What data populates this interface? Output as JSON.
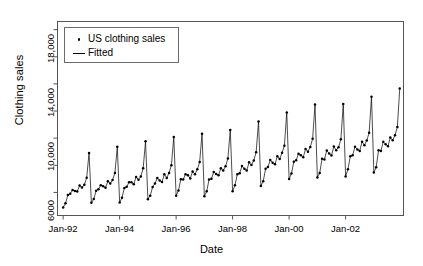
{
  "chart_data": {
    "type": "line",
    "title": "",
    "xlabel": "Date",
    "ylabel": "Clothing sales",
    "grid": false,
    "legend_position": "top-left",
    "xlim": [
      1991.8,
      2004.05
    ],
    "ylim": [
      4300,
      18600
    ],
    "y_ticks_major": [
      6000,
      10000,
      14000,
      18000
    ],
    "y_tick_labels": [
      "6000",
      "10,000",
      "14,000",
      "18,000"
    ],
    "y_ticks_minor": [
      8000,
      12000,
      16000
    ],
    "x_ticks": [
      1992,
      1994,
      1996,
      1998,
      2000,
      2002
    ],
    "x_tick_labels": [
      "Jan-92",
      "Jan-94",
      "Jan-96",
      "Jan-98",
      "Jan-00",
      "Jan-02"
    ],
    "series": [
      {
        "name": "US clothing sales",
        "kind": "points",
        "marker": "dot",
        "color": "#000000",
        "x": [
          1992.0,
          1992.083,
          1992.167,
          1992.25,
          1992.333,
          1992.417,
          1992.5,
          1992.583,
          1992.667,
          1992.75,
          1992.833,
          1992.917,
          1993.0,
          1993.083,
          1993.167,
          1993.25,
          1993.333,
          1993.417,
          1993.5,
          1993.583,
          1993.667,
          1993.75,
          1993.833,
          1993.917,
          1994.0,
          1994.083,
          1994.167,
          1994.25,
          1994.333,
          1994.417,
          1994.5,
          1994.583,
          1994.667,
          1994.75,
          1994.833,
          1994.917,
          1995.0,
          1995.083,
          1995.167,
          1995.25,
          1995.333,
          1995.417,
          1995.5,
          1995.583,
          1995.667,
          1995.75,
          1995.833,
          1995.917,
          1996.0,
          1996.083,
          1996.167,
          1996.25,
          1996.333,
          1996.417,
          1996.5,
          1996.583,
          1996.667,
          1996.75,
          1996.833,
          1996.917,
          1997.0,
          1997.083,
          1997.167,
          1997.25,
          1997.333,
          1997.417,
          1997.5,
          1997.583,
          1997.667,
          1997.75,
          1997.833,
          1997.917,
          1998.0,
          1998.083,
          1998.167,
          1998.25,
          1998.333,
          1998.417,
          1998.5,
          1998.583,
          1998.667,
          1998.75,
          1998.833,
          1998.917,
          1999.0,
          1999.083,
          1999.167,
          1999.25,
          1999.333,
          1999.417,
          1999.5,
          1999.583,
          1999.667,
          1999.75,
          1999.833,
          1999.917,
          2000.0,
          2000.083,
          2000.167,
          2000.25,
          2000.333,
          2000.417,
          2000.5,
          2000.583,
          2000.667,
          2000.75,
          2000.833,
          2000.917,
          2001.0,
          2001.083,
          2001.167,
          2001.25,
          2001.333,
          2001.417,
          2001.5,
          2001.583,
          2001.667,
          2001.75,
          2001.833,
          2001.917,
          2002.0,
          2002.083,
          2002.167,
          2002.25,
          2002.333,
          2002.417,
          2002.5,
          2002.583,
          2002.667,
          2002.75,
          2002.833,
          2002.917,
          2003.0,
          2003.083,
          2003.167,
          2003.25,
          2003.333,
          2003.417,
          2003.5,
          2003.583,
          2003.667,
          2003.75,
          2003.833,
          2003.917
        ],
        "y": [
          4889,
          5197,
          5805,
          5912,
          6171,
          6100,
          6077,
          6513,
          6357,
          6562,
          7078,
          8910,
          5246,
          5510,
          6127,
          6244,
          6534,
          6451,
          6354,
          6831,
          6655,
          6918,
          7432,
          9375,
          5261,
          5611,
          6334,
          6419,
          6757,
          6743,
          6601,
          7139,
          6944,
          7182,
          7780,
          9770,
          5507,
          5763,
          6396,
          6653,
          7056,
          6887,
          6762,
          7338,
          7073,
          7441,
          8006,
          10091,
          5754,
          6138,
          6977,
          6949,
          7348,
          7275,
          7022,
          7540,
          7338,
          7708,
          8235,
          10330,
          5722,
          6085,
          6962,
          7003,
          7512,
          7365,
          7258,
          7783,
          7613,
          7930,
          8496,
          10605,
          6088,
          6534,
          7336,
          7417,
          7955,
          7742,
          7617,
          8222,
          8020,
          8355,
          8968,
          11226,
          6469,
          6819,
          7739,
          7872,
          8390,
          8197,
          8081,
          8669,
          8460,
          8930,
          9437,
          11897,
          6991,
          7396,
          8268,
          8378,
          8843,
          8740,
          8586,
          9209,
          9006,
          9358,
          9949,
          12484,
          7109,
          7436,
          8477,
          8422,
          9099,
          8869,
          8724,
          9386,
          9117,
          9338,
          9912,
          12521,
          7180,
          7713,
          8664,
          8736,
          9372,
          9165,
          9059,
          9742,
          9481,
          9823,
          10391,
          13060,
          7477,
          7861,
          9103,
          9058,
          9731,
          9555,
          9405,
          10052,
          9843,
          10214,
          10830,
          13666
        ],
        "notable_values": {
          "first_point": 4889,
          "last_point": 13666,
          "max": 13666,
          "min": 4889,
          "december_peaks": [
            8910,
            9375,
            9770,
            10091,
            10330,
            10605,
            11226,
            11897,
            12484,
            12521,
            13060,
            13666
          ]
        }
      },
      {
        "name": "Fitted",
        "kind": "line",
        "color": "#000000"
      }
    ]
  },
  "axis": {
    "ylabel": "Clothing sales",
    "xlabel": "Date"
  },
  "legend": {
    "items": [
      {
        "label": "US clothing sales",
        "key": "dot-marker"
      },
      {
        "label": "Fitted",
        "key": "line-marker"
      }
    ]
  },
  "colors": {
    "axis": "#555555",
    "data": "#000000",
    "background": "#ffffff"
  }
}
